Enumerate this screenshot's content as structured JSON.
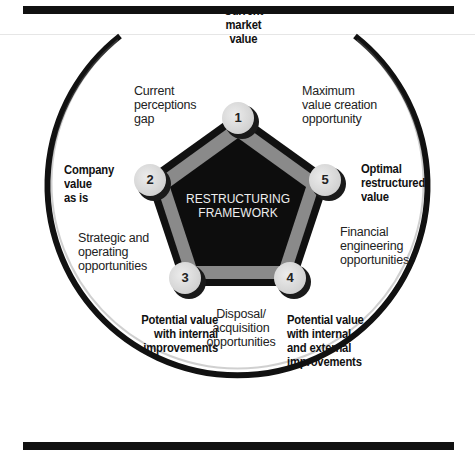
{
  "frame": {
    "top_rule_color": "#111111",
    "bottom_rule_color": "#111111"
  },
  "framework": {
    "title_line1": "RESTRUCTURING",
    "title_line2": "FRAMEWORK",
    "colors": {
      "core_fill": "#0d0d0d",
      "ring_fill": "#8a8a8a",
      "outline": "#111111",
      "node_fill": "#d9d9d9",
      "node_shadow": "#1a1a1a"
    }
  },
  "nodes": [
    {
      "number": "1",
      "label_lines": [
        "Current",
        "market",
        "value"
      ]
    },
    {
      "number": "2",
      "label_lines": [
        "Company",
        "value",
        "as is"
      ]
    },
    {
      "number": "3",
      "label_lines": [
        "Potential value",
        "with internal",
        "improvements"
      ]
    },
    {
      "number": "4",
      "label_lines": [
        "Potential value",
        "with internal",
        "and external",
        "improvements"
      ]
    },
    {
      "number": "5",
      "label_lines": [
        "Optimal",
        "restructured",
        "value"
      ]
    }
  ],
  "edges": [
    {
      "between": "1-2",
      "label_lines": [
        "Current",
        "perceptions",
        "gap"
      ]
    },
    {
      "between": "1-5",
      "label_lines": [
        "Maximum",
        "value creation",
        "opportunity"
      ]
    },
    {
      "between": "2-3",
      "label_lines": [
        "Strategic and",
        "operating",
        "opportunities"
      ]
    },
    {
      "between": "3-4",
      "label_lines": [
        "Disposal/",
        "acquisition",
        "opportunities"
      ]
    },
    {
      "between": "4-5",
      "label_lines": [
        "Financial",
        "engineering",
        "opportunities"
      ]
    }
  ]
}
